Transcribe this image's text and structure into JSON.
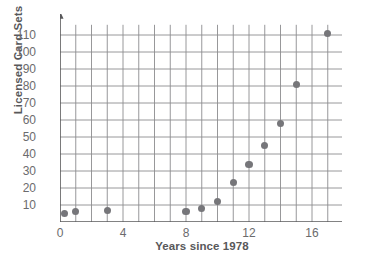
{
  "chart_data": {
    "type": "scatter",
    "title": "",
    "xlabel": "Years since 1978",
    "ylabel": "Licensed Card Sets",
    "xlim": [
      0,
      18
    ],
    "ylim": [
      0,
      118
    ],
    "xticks": [
      0,
      4,
      8,
      12,
      16
    ],
    "yticks": [
      10,
      20,
      30,
      40,
      50,
      60,
      70,
      80,
      90,
      100,
      110
    ],
    "x_axis_symbol": "t",
    "grid": true,
    "grid_x_step": 1,
    "grid_y_step": 10,
    "legend": "none",
    "marker_color": "#76767a",
    "grid_color": "#8c8c8e",
    "axis_color": "#58585a",
    "points": [
      {
        "x": 0.3,
        "y": 5
      },
      {
        "x": 1,
        "y": 6
      },
      {
        "x": 3,
        "y": 7
      },
      {
        "x": 8,
        "y": 6
      },
      {
        "x": 9,
        "y": 8
      },
      {
        "x": 10,
        "y": 12
      },
      {
        "x": 11,
        "y": 23
      },
      {
        "x": 12,
        "y": 34
      },
      {
        "x": 13,
        "y": 45
      },
      {
        "x": 14,
        "y": 58
      },
      {
        "x": 15,
        "y": 81
      },
      {
        "x": 17,
        "y": 111
      }
    ]
  },
  "ticks": {
    "y": [
      "110",
      "100",
      "90",
      "80",
      "70",
      "60",
      "50",
      "40",
      "30",
      "20",
      "10"
    ],
    "x": [
      "0",
      "4",
      "8",
      "12",
      "16"
    ]
  },
  "labels": {
    "y_axis_title": "Licensed Card Sets",
    "x_axis_title": "Years since 1978",
    "x_axis_variable": "t"
  }
}
